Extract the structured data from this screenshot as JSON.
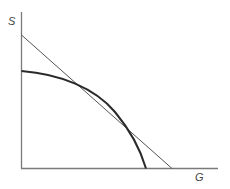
{
  "diagram": {
    "type": "production-possibility-frontier-with-tangent",
    "axes": {
      "y_label": "S",
      "x_label": "G"
    },
    "colors": {
      "axis": "#7a7a7a",
      "curve": "#2a2a2a",
      "tangent": "#555555",
      "label": "#444444"
    },
    "elements": [
      {
        "name": "frontier-curve",
        "kind": "concave curve",
        "from": "S-axis intercept",
        "to": "G-axis intercept"
      },
      {
        "name": "tangent-line",
        "kind": "straight line",
        "touches": "frontier-curve at one point"
      }
    ]
  }
}
